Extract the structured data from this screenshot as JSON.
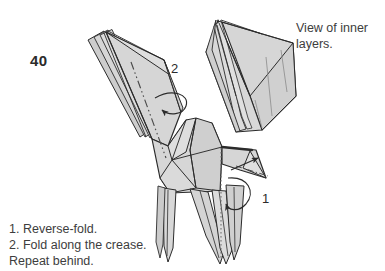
{
  "figure": {
    "kind": "origami-instruction-diagram",
    "step_number": "40",
    "model_colors": {
      "paper_fill": "#d4d4d4",
      "paper_fill_light": "#e2e2e2",
      "paper_fill_dark": "#bfbfbf",
      "outline": "#2b2b2b",
      "thin_line": "#6b6b6b",
      "crease_line": "#4a4a4a",
      "background": "#ffffff",
      "text": "#3d3d3d"
    }
  },
  "inset": {
    "caption_line_1": "View of inner",
    "caption_line_2": "layers."
  },
  "callouts": {
    "one": "1",
    "two": "2"
  },
  "instructions": {
    "line_1": "1. Reverse-fold.",
    "line_2": "2. Fold along the crease.",
    "line_3": "Repeat behind."
  }
}
